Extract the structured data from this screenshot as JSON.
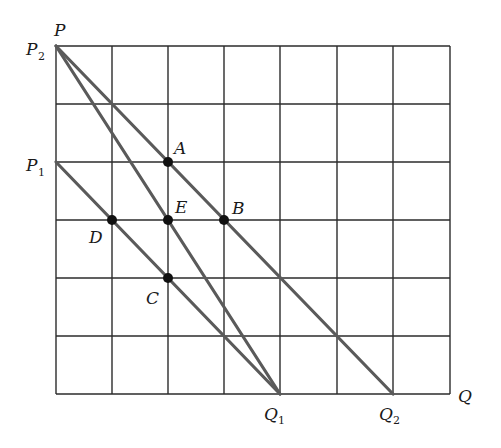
{
  "diagram": {
    "grid": {
      "columns": 7,
      "rows": 6,
      "x0": 56,
      "y0": 46,
      "cell_width": 56.3,
      "cell_height": 58,
      "line_color": "#2b2b2b"
    },
    "axis_labels": {
      "vertical_axis": "P",
      "horizontal_axis": "Q"
    },
    "intercepts": {
      "P2": {
        "main": "P",
        "sub": "2"
      },
      "P1": {
        "main": "P",
        "sub": "1"
      },
      "Q1": {
        "main": "Q",
        "sub": "1"
      },
      "Q2": {
        "main": "Q",
        "sub": "2"
      }
    },
    "lines": [
      {
        "name": "P2-Q2",
        "from": "P2",
        "to": "Q2",
        "passes_through": [
          "A",
          "B"
        ]
      },
      {
        "name": "P2-Q1",
        "from": "P2",
        "to": "Q1",
        "passes_through": [
          "E"
        ]
      },
      {
        "name": "P1-Q1",
        "from": "P1",
        "to": "Q1",
        "passes_through": [
          "D",
          "C"
        ]
      }
    ],
    "line_color": "#5a5a5a",
    "points": {
      "A": {
        "label": "A",
        "grid": [
          2,
          2
        ]
      },
      "B": {
        "label": "B",
        "grid": [
          3,
          3
        ]
      },
      "E": {
        "label": "E",
        "grid": [
          2,
          3
        ]
      },
      "D": {
        "label": "D",
        "grid": [
          1,
          3
        ]
      },
      "C": {
        "label": "C",
        "grid": [
          2,
          4
        ]
      }
    }
  }
}
